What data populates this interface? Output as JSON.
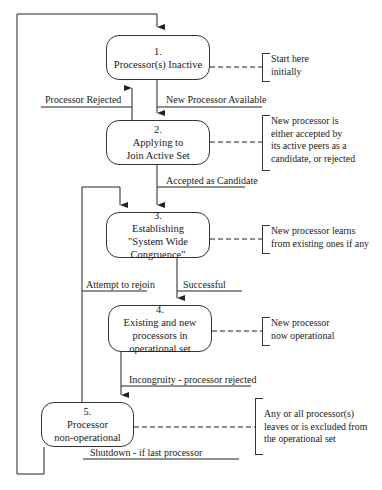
{
  "diagram": {
    "type": "state-transition",
    "states": [
      {
        "number": "1.",
        "lines": [
          "Processor(s) Inactive"
        ]
      },
      {
        "number": "2.",
        "lines": [
          "Applying to",
          "Join Active Set"
        ]
      },
      {
        "number": "3.",
        "lines": [
          "Establishing",
          "\"System Wide",
          "Congruence\""
        ]
      },
      {
        "number": "4.",
        "lines": [
          "Existing and new",
          "processors in",
          "operational set"
        ]
      },
      {
        "number": "5.",
        "lines": [
          "Processor",
          "non-operational"
        ]
      }
    ],
    "transitions": [
      {
        "label": "Processor Rejected",
        "from": "2",
        "to": "1"
      },
      {
        "label": "New Processor Available",
        "from": "1",
        "to": "2"
      },
      {
        "label": "Accepted as Candidate",
        "from": "2",
        "to": "3"
      },
      {
        "label": "Successful",
        "from": "3",
        "to": "4"
      },
      {
        "label": "Attempt to rejoin",
        "from": "5",
        "to": "3"
      },
      {
        "label": "Incongruity - processor rejected",
        "from": "4",
        "to": "5"
      },
      {
        "label": "Shutdown - if last processor",
        "from": "5",
        "to": "1"
      }
    ],
    "notes": [
      {
        "state": "1",
        "lines": [
          "Start here",
          "initially"
        ]
      },
      {
        "state": "2",
        "lines": [
          "New processor is",
          "either accepted by",
          "its active peers as a",
          "candidate, or rejected"
        ]
      },
      {
        "state": "3",
        "lines": [
          "New processor learns",
          "from existing ones if any"
        ]
      },
      {
        "state": "4",
        "lines": [
          "New processor",
          "now operational"
        ]
      },
      {
        "state": "5",
        "lines": [
          "Any or all processor(s)",
          "leaves or is excluded from",
          "the operational set"
        ]
      }
    ]
  }
}
